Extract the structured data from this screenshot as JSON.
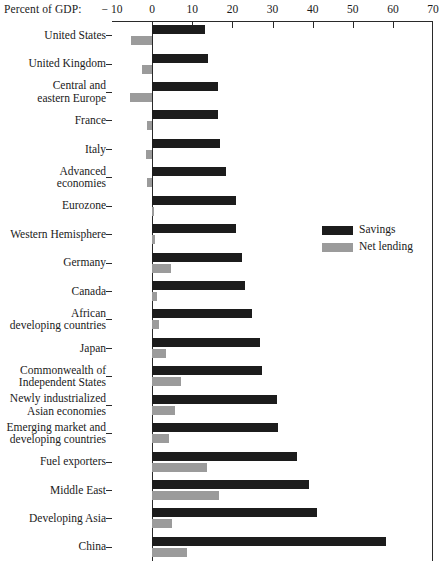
{
  "chart_data": {
    "type": "bar",
    "orientation": "horizontal",
    "title": "",
    "xlabel": "Percent of GDP:",
    "ylabel": "",
    "xlim": [
      -10,
      70
    ],
    "xticks": [
      -10,
      0,
      10,
      20,
      30,
      40,
      50,
      60,
      70
    ],
    "xtick_labels": [
      "− 10",
      "0",
      "10",
      "20",
      "30",
      "40",
      "50",
      "60",
      "70"
    ],
    "grid": false,
    "legend_position": "right-middle",
    "categories": [
      "United States",
      "United Kingdom",
      "Central and\neastern Europe",
      "France",
      "Italy",
      "Advanced\neconomies",
      "Eurozone",
      "Western Hemisphere",
      "Germany",
      "Canada",
      "African\ndeveloping countries",
      "Japan",
      "Commonwealth of\nIndependent States",
      "Newly industrialized\nAsian economies",
      "Emerging market and\ndeveloping countries",
      "Fuel exporters",
      "Middle East",
      "Developing Asia",
      "China"
    ],
    "series": [
      {
        "name": "Savings",
        "color": "#1c1c1c",
        "values": [
          13.2,
          14.0,
          16.5,
          16.3,
          16.8,
          18.4,
          20.8,
          21.0,
          22.3,
          23.2,
          24.8,
          27.0,
          27.4,
          31.0,
          31.3,
          36.0,
          39.0,
          41.0,
          58.4
        ]
      },
      {
        "name": "Net lending",
        "color": "#9b9b9b",
        "values": [
          -5.3,
          -2.4,
          -5.6,
          -1.2,
          -1.6,
          -1.2,
          0.4,
          0.8,
          4.8,
          1.1,
          1.6,
          3.4,
          7.2,
          5.6,
          4.2,
          13.8,
          16.6,
          5.0,
          8.6
        ]
      }
    ]
  },
  "legend": {
    "items": [
      {
        "label": "Savings",
        "color": "#1c1c1c",
        "swatch_name": "legend-swatch-savings"
      },
      {
        "label": "Net lending",
        "color": "#9b9b9b",
        "swatch_name": "legend-swatch-net-lending"
      }
    ]
  }
}
